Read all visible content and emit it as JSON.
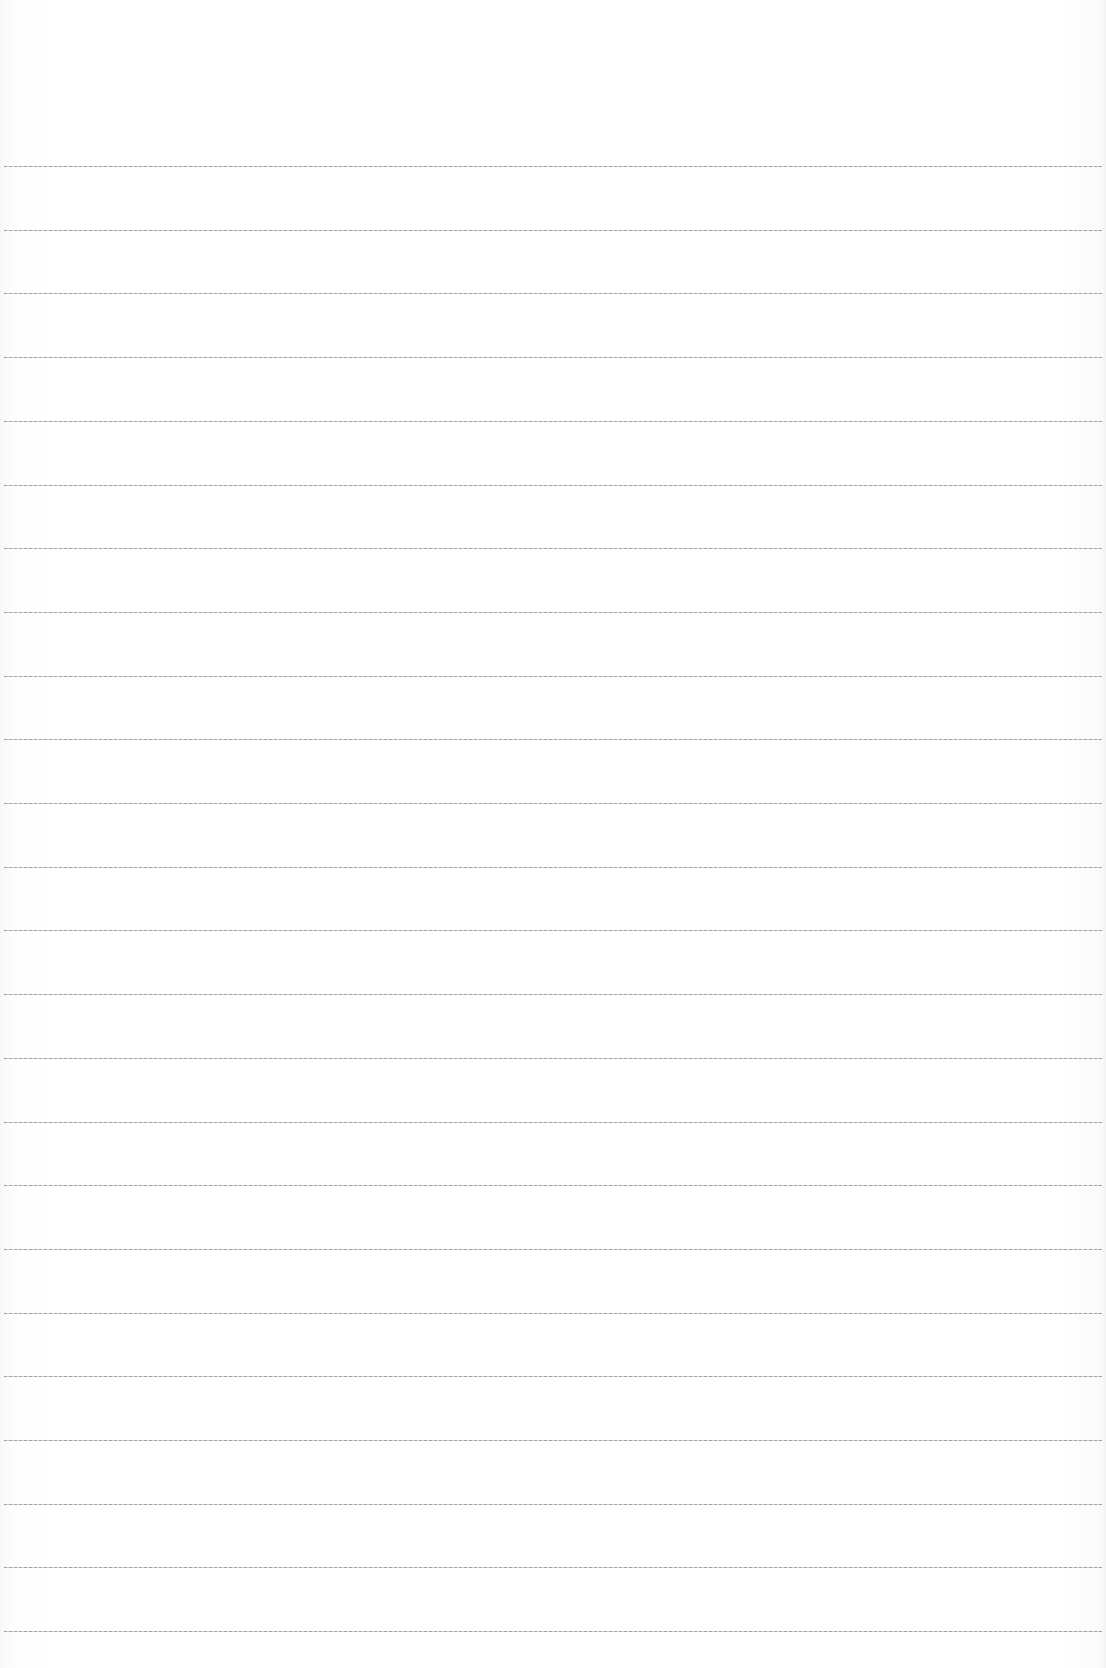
{
  "page": {
    "type": "lined-paper",
    "background_color": "#ffffff",
    "rule_color": "#8a8a8a",
    "rule_count": 24,
    "first_rule_y": 166,
    "rule_spacing": 63.7,
    "text_content": []
  }
}
